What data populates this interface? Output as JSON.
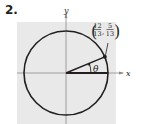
{
  "problem": {
    "number_label": "2."
  },
  "figure": {
    "type": "unit-circle",
    "axes": {
      "x_label": "x",
      "y_label": "y"
    },
    "point": {
      "label_x_num": "12",
      "label_x_den": "13",
      "label_y_num": "5",
      "label_y_den": "13",
      "separator": ",",
      "x": 0.923,
      "y": 0.385
    },
    "angle_label": "θ",
    "colors": {
      "background_grid": "#e8e8e8",
      "ink": "#231f20",
      "axis": "#7a7a7a"
    }
  }
}
